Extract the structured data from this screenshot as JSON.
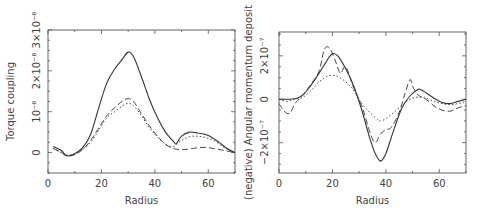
{
  "chart_data": [
    {
      "type": "line",
      "title": "",
      "xlabel": "Radius",
      "ylabel": "Torque coupling",
      "xlim": [
        0,
        70
      ],
      "ylim": [
        -5e-07,
        3e-06
      ],
      "x_ticks": [
        0,
        20,
        40,
        60
      ],
      "x_tick_labels": [
        "0",
        "20",
        "40",
        "60"
      ],
      "y_ticks": [
        0,
        1e-06,
        2e-06,
        3e-06
      ],
      "y_tick_labels": [
        "0",
        "10⁻⁶",
        "2×10⁻⁶",
        "3×10⁻⁶"
      ],
      "grid": false,
      "legend": "none",
      "series": [
        {
          "name": "solid",
          "style": "solid",
          "x": [
            2,
            5,
            7,
            10,
            13,
            16,
            19,
            22,
            25,
            28,
            30,
            32,
            35,
            38,
            41,
            44,
            47,
            48,
            50,
            53,
            56,
            60,
            64,
            67,
            70
          ],
          "y": [
            1.5e-07,
            5e-08,
            -8e-08,
            -3e-08,
            1.2e-07,
            4.5e-07,
            1.1e-06,
            1.7e-06,
            2.05e-06,
            2.3e-06,
            2.46e-06,
            2.35e-06,
            1.85e-06,
            1.3e-06,
            8.5e-07,
            5e-07,
            2.7e-07,
            2.2e-07,
            4e-07,
            5e-07,
            4.8e-07,
            4.2e-07,
            2.5e-07,
            1e-07,
            0.0
          ]
        },
        {
          "name": "dashed",
          "style": "dashed",
          "x": [
            2,
            5,
            7,
            10,
            13,
            16,
            19,
            22,
            25,
            28,
            30,
            32,
            35,
            38,
            41,
            44,
            47,
            50,
            54,
            58,
            62,
            66,
            70
          ],
          "y": [
            1e-07,
            0.0,
            -8e-08,
            -5e-08,
            8e-08,
            3e-07,
            6e-07,
            9e-07,
            1.1e-06,
            1.27e-06,
            1.32e-06,
            1.25e-06,
            9.5e-07,
            6.5e-07,
            4e-07,
            2e-07,
            1e-07,
            7e-08,
            1e-07,
            1.3e-07,
            1e-07,
            5e-08,
            0.0
          ]
        },
        {
          "name": "dotted",
          "style": "dotted",
          "x": [
            2,
            5,
            7,
            10,
            13,
            16,
            19,
            22,
            25,
            28,
            30,
            32,
            35,
            38,
            41,
            44,
            47,
            50,
            54,
            58,
            62,
            66,
            70
          ],
          "y": [
            1e-07,
            0.0,
            -6e-08,
            -4e-08,
            8e-08,
            2.5e-07,
            5.5e-07,
            8.5e-07,
            1e-06,
            1.15e-06,
            1.2e-06,
            1.15e-06,
            9e-07,
            6e-07,
            3.8e-07,
            2e-07,
            1.5e-07,
            3e-07,
            4e-07,
            3.8e-07,
            3e-07,
            1.2e-07,
            0.0
          ]
        }
      ]
    },
    {
      "type": "line",
      "title": "",
      "xlabel": "Radius",
      "ylabel": "(negative) Angular momentum deposit",
      "xlim": [
        0,
        70
      ],
      "ylim": [
        -3.4e-07,
        3.1e-07
      ],
      "x_ticks": [
        0,
        20,
        40,
        60
      ],
      "x_tick_labels": [
        "0",
        "20",
        "40",
        "60"
      ],
      "y_ticks": [
        -2e-07,
        0,
        2e-07
      ],
      "y_tick_labels": [
        "−2×10⁻⁷",
        "0",
        "2×10⁻⁷"
      ],
      "grid": false,
      "legend": "none",
      "series": [
        {
          "name": "solid",
          "style": "solid",
          "x": [
            0,
            3,
            6,
            9,
            12,
            15,
            18,
            20,
            22,
            25,
            28,
            31,
            34,
            36,
            38,
            40,
            43,
            46,
            49,
            52,
            53,
            55,
            58,
            61,
            64,
            67,
            70
          ],
          "y": [
            0.0,
            0.0,
            2e-09,
            2e-08,
            6.5e-08,
            1.2e-07,
            1.8e-07,
            2.1e-07,
            2e-07,
            1.4e-07,
            6e-08,
            -5e-08,
            -1.8e-07,
            -2.5e-07,
            -2.85e-07,
            -2.5e-07,
            -1.4e-07,
            -4e-08,
            1.5e-08,
            4.5e-08,
            4.5e-08,
            3e-08,
            5e-09,
            -1.5e-08,
            -2e-08,
            -1e-08,
            0.0
          ]
        },
        {
          "name": "dashed",
          "style": "dashed",
          "x": [
            0,
            2,
            4,
            6,
            9,
            12,
            15,
            17,
            19,
            21,
            23,
            25,
            28,
            31,
            34,
            36,
            38,
            40,
            42,
            45,
            47,
            49,
            50,
            52,
            55,
            58,
            61,
            64,
            67,
            70
          ],
          "y": [
            -2e-08,
            -5.5e-08,
            -6.5e-08,
            -2e-08,
            2e-08,
            7e-08,
            1.3e-07,
            2.3e-07,
            2.35e-07,
            1.8e-07,
            1.2e-07,
            1.5e-07,
            5e-08,
            -3e-08,
            -1.5e-07,
            -2e-07,
            -1.6e-07,
            -1.4e-07,
            -1.3e-07,
            -6e-08,
            2e-08,
            9e-08,
            6e-08,
            2e-08,
            0.0,
            -3e-08,
            -5e-08,
            -5.5e-08,
            -4e-08,
            -3e-08
          ]
        },
        {
          "name": "dotted",
          "style": "dotted",
          "x": [
            0,
            3,
            6,
            9,
            12,
            15,
            18,
            20,
            22,
            25,
            28,
            31,
            34,
            37,
            38,
            40,
            43,
            46,
            49,
            52,
            55,
            58,
            61,
            64,
            67,
            70
          ],
          "y": [
            0.0,
            -1e-08,
            0.0,
            1e-08,
            4e-08,
            8e-08,
            1.05e-07,
            1.1e-07,
            1.05e-07,
            8e-08,
            4e-08,
            -2e-08,
            -6e-08,
            -9.5e-08,
            -1e-07,
            -9e-08,
            -6e-08,
            -3e-08,
            0.0,
            1e-08,
            5e-09,
            -1e-08,
            -2e-08,
            -2.5e-08,
            -2e-08,
            -1e-08
          ]
        }
      ]
    }
  ]
}
